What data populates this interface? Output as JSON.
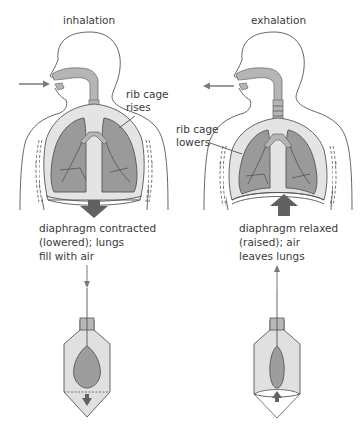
{
  "diagram": {
    "panels": [
      {
        "id": "inhalation",
        "title": "inhalation",
        "rib_label_line1": "rib cage",
        "rib_label_line2": "rises",
        "caption_line1": "diaphragm contracted",
        "caption_line2": "(lowered); lungs",
        "caption_line3": "fill with air",
        "air_flow": "in",
        "diaphragm_direction": "down"
      },
      {
        "id": "exhalation",
        "title": "exhalation",
        "rib_label_line1": "rib cage",
        "rib_label_line2": "lowers",
        "caption_line1": "diaphragm relaxed",
        "caption_line2": "(raised); air",
        "caption_line3": "leaves lungs",
        "air_flow": "out",
        "diaphragm_direction": "up"
      }
    ],
    "colors": {
      "lung": "#9a9a9a",
      "pleura": "#e4e4e4",
      "arrow": "#616161",
      "outline": "#555555"
    }
  }
}
